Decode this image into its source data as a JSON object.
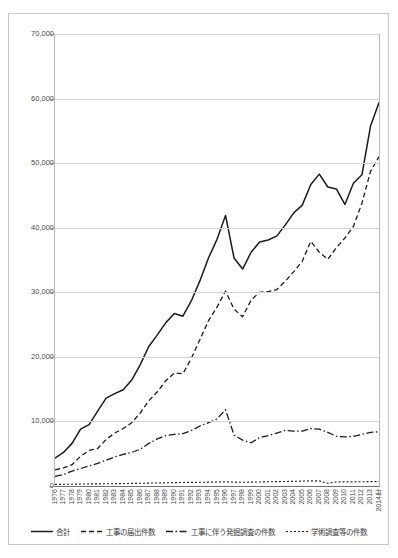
{
  "chart_data": {
    "type": "line",
    "title": "",
    "xlabel": "年",
    "ylabel": "",
    "ylim": [
      0,
      70000
    ],
    "yticks": [
      0,
      10000,
      20000,
      30000,
      40000,
      50000,
      60000,
      70000
    ],
    "ytick_labels": [
      "0",
      "10,000",
      "20,000",
      "30,000",
      "40,000",
      "50,000",
      "60,000",
      "70,000"
    ],
    "grid": true,
    "legend_position": "bottom",
    "x_axis_suffix": "年",
    "categories": [
      "1976",
      "1977",
      "1978",
      "1979",
      "1980",
      "1981",
      "1982",
      "1983",
      "1984",
      "1985",
      "1986",
      "1987",
      "1988",
      "1989",
      "1990",
      "1991",
      "1992",
      "1993",
      "1994",
      "1995",
      "1996",
      "1997",
      "1998",
      "1999",
      "2000",
      "2001",
      "2002",
      "2003",
      "2004",
      "2005",
      "2006",
      "2007",
      "2008",
      "2009",
      "2010",
      "2011",
      "2012",
      "2013",
      "2014"
    ],
    "series": [
      {
        "name": "合計",
        "style": "solid",
        "color": "#1c1c1c",
        "values": [
          4300,
          5200,
          6600,
          8800,
          9500,
          11600,
          13600,
          14300,
          14900,
          16400,
          18800,
          21600,
          23400,
          25300,
          26700,
          26300,
          28700,
          31800,
          35300,
          38200,
          41900,
          35300,
          33600,
          36200,
          37800,
          38100,
          38700,
          40400,
          42300,
          43500,
          46700,
          48300,
          46300,
          46000,
          43600,
          46900,
          48200,
          55700,
          59400
        ]
      },
      {
        "name": "工事の届出件数",
        "style": "dashed",
        "color": "#1c1c1c",
        "values": [
          2500,
          2800,
          3300,
          4600,
          5500,
          5800,
          7200,
          8200,
          8900,
          9800,
          11300,
          13200,
          14600,
          16300,
          17500,
          17400,
          19800,
          22700,
          25600,
          27700,
          30200,
          27400,
          26200,
          28800,
          30000,
          30100,
          30400,
          31700,
          33200,
          34800,
          37900,
          36200,
          35100,
          36900,
          38400,
          40200,
          43800,
          48700,
          51000
        ]
      },
      {
        "name": "工事に伴う発掘調査の件数",
        "style": "dashdot",
        "color": "#1c1c1c",
        "values": [
          1500,
          1800,
          2300,
          2700,
          3100,
          3500,
          4000,
          4500,
          4900,
          5200,
          5700,
          6600,
          7300,
          7800,
          8000,
          8100,
          8600,
          9300,
          9800,
          10400,
          11800,
          7900,
          7100,
          6700,
          7500,
          7800,
          8200,
          8600,
          8500,
          8500,
          8900,
          8800,
          8300,
          7700,
          7600,
          7700,
          8000,
          8300,
          8400
        ]
      },
      {
        "name": "学術調査等の件数",
        "style": "dotted",
        "color": "#1c1c1c",
        "values": [
          250,
          260,
          280,
          300,
          320,
          330,
          350,
          360,
          380,
          400,
          420,
          450,
          470,
          500,
          520,
          540,
          560,
          580,
          600,
          620,
          650,
          600,
          580,
          600,
          620,
          650,
          680,
          700,
          720,
          760,
          800,
          780,
          420,
          620,
          650,
          640,
          660,
          680,
          700
        ]
      }
    ],
    "legend": [
      {
        "label": "合計",
        "style": "solid"
      },
      {
        "label": "工事の届出件数",
        "style": "dashed"
      },
      {
        "label": "工事に伴う発掘調査の件数",
        "style": "dashdot"
      },
      {
        "label": "学術調査等の件数",
        "style": "dotted"
      }
    ]
  }
}
